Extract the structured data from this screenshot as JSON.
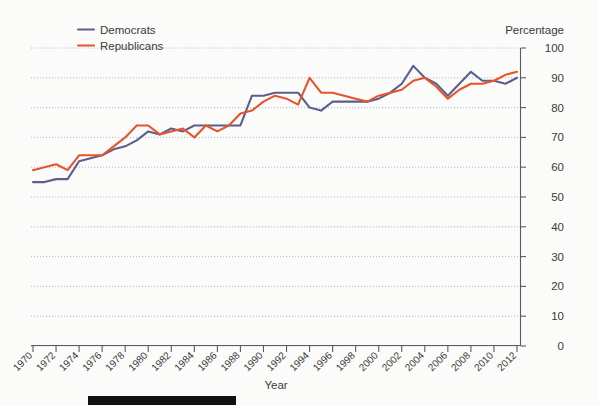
{
  "legend": {
    "position": "top-left",
    "items": [
      {
        "label": "Democrats",
        "color": "#5a5f8f"
      },
      {
        "label": "Republicans",
        "color": "#e8542a"
      }
    ]
  },
  "axes": {
    "y_title": "Percentage",
    "x_title": "Year",
    "y_ticks": [
      "100",
      "90",
      "80",
      "70",
      "60",
      "50",
      "40",
      "30",
      "20",
      "10",
      "0"
    ],
    "x_ticks": [
      "1970",
      "1972",
      "1974",
      "1976",
      "1978",
      "1980",
      "1982",
      "1984",
      "1986",
      "1988",
      "1990",
      "1992",
      "1994",
      "1996",
      "1998",
      "2000",
      "2002",
      "2004",
      "2006",
      "2008",
      "2010",
      "2012"
    ]
  },
  "chart_data": {
    "type": "line",
    "title": "",
    "xlabel": "Year",
    "ylabel": "Percentage",
    "xlim": [
      1970,
      2012
    ],
    "ylim": [
      0,
      100
    ],
    "grid": true,
    "legend_position": "top-left",
    "x": [
      1970,
      1971,
      1972,
      1973,
      1974,
      1975,
      1976,
      1977,
      1978,
      1979,
      1980,
      1981,
      1982,
      1983,
      1984,
      1985,
      1986,
      1987,
      1988,
      1989,
      1990,
      1991,
      1992,
      1993,
      1994,
      1995,
      1996,
      1997,
      1998,
      1999,
      2000,
      2001,
      2002,
      2003,
      2004,
      2005,
      2006,
      2007,
      2008,
      2009,
      2010,
      2011,
      2012
    ],
    "series": [
      {
        "name": "Democrats",
        "color": "#5a5f8f",
        "values": [
          55,
          55,
          56,
          56,
          62,
          63,
          64,
          66,
          67,
          69,
          72,
          71,
          73,
          72,
          74,
          74,
          74,
          74,
          74,
          84,
          84,
          85,
          85,
          85,
          80,
          79,
          82,
          82,
          82,
          82,
          83,
          85,
          88,
          94,
          90,
          88,
          84,
          88,
          92,
          89,
          89,
          88,
          90
        ]
      },
      {
        "name": "Republicans",
        "color": "#e8542a",
        "values": [
          59,
          60,
          61,
          59,
          64,
          64,
          64,
          67,
          70,
          74,
          74,
          71,
          72,
          73,
          70,
          74,
          72,
          74,
          78,
          79,
          82,
          84,
          83,
          81,
          90,
          85,
          85,
          84,
          83,
          82,
          84,
          85,
          86,
          89,
          90,
          87,
          83,
          86,
          88,
          88,
          89,
          91,
          92
        ]
      }
    ]
  },
  "decor": {
    "bottom_bar_color": "#111113"
  }
}
